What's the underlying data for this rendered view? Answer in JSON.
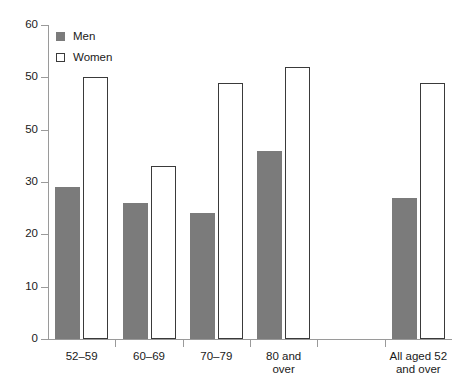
{
  "chart_data": {
    "type": "bar",
    "title": "",
    "xlabel": "",
    "ylabel": "",
    "ylim": [
      0,
      60
    ],
    "yticks": [
      0,
      10,
      20,
      30,
      "50",
      50,
      60
    ],
    "grid": false,
    "legend_position": "top-left",
    "categories": [
      "52–59",
      "60–69",
      "70–79",
      "80 and\nover",
      "All aged 52\nand over"
    ],
    "series": [
      {
        "name": "Men",
        "color": "#7b7b7b",
        "values": [
          29,
          26,
          24,
          36,
          27
        ]
      },
      {
        "name": "Women",
        "color": "#ffffff",
        "values": [
          50,
          33,
          49,
          52,
          49
        ]
      }
    ]
  },
  "legend": {
    "items": [
      {
        "label": "Men",
        "swatch": "filled-gray-square"
      },
      {
        "label": "Women",
        "swatch": "outlined-white-square"
      }
    ]
  },
  "axis": {
    "y_tick_labels": [
      "60",
      "50",
      "50",
      "30",
      "20",
      "10",
      "0"
    ]
  }
}
